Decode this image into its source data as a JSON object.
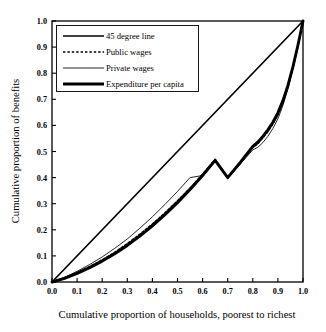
{
  "chart_data": {
    "type": "line",
    "title": "",
    "xlabel": "Cumulative proportion of households, poorest to richest",
    "ylabel": "Cumulative proportion of benefits",
    "xlim": [
      0.0,
      1.0
    ],
    "ylim": [
      0.0,
      1.0
    ],
    "grid": false,
    "legend_position": "top-left inside plot area",
    "xticks": [
      "0.0",
      "0.1",
      "0.2",
      "0.3",
      "0.4",
      "0.5",
      "0.6",
      "0.7",
      "0.8",
      "0.9",
      "1.0"
    ],
    "yticks": [
      "0.0",
      "0.1",
      "0.2",
      "0.3",
      "0.4",
      "0.5",
      "0.6",
      "0.7",
      "0.8",
      "0.9",
      "1.0"
    ],
    "xtick_values": [
      0.0,
      0.1,
      0.2,
      0.3,
      0.4,
      0.5,
      0.6,
      0.7,
      0.8,
      0.9,
      1.0
    ],
    "ytick_values": [
      0.0,
      0.1,
      0.2,
      0.3,
      0.4,
      0.5,
      0.6,
      0.7,
      0.8,
      0.9,
      1.0
    ],
    "series": [
      {
        "name": "45 degree line",
        "style": "solid-medium",
        "x": [
          0.0,
          1.0
        ],
        "values": [
          0.0,
          1.0
        ]
      },
      {
        "name": "Public wages",
        "style": "dotted",
        "x": [
          0.0,
          0.05,
          0.1,
          0.15,
          0.2,
          0.25,
          0.3,
          0.35,
          0.4,
          0.45,
          0.5,
          0.55,
          0.6,
          0.65,
          0.7,
          0.75,
          0.8,
          0.82,
          0.84,
          0.86,
          0.88,
          0.9,
          0.92,
          0.94,
          0.96,
          0.98,
          1.0
        ],
        "values": [
          0.0,
          0.016,
          0.036,
          0.059,
          0.085,
          0.114,
          0.147,
          0.183,
          0.222,
          0.265,
          0.311,
          0.36,
          0.413,
          0.47,
          0.4,
          0.455,
          0.515,
          0.53,
          0.552,
          0.576,
          0.605,
          0.64,
          0.688,
          0.748,
          0.822,
          0.905,
          1.0
        ]
      },
      {
        "name": "Private wages",
        "style": "solid-thin",
        "x": [
          0.0,
          0.05,
          0.1,
          0.15,
          0.2,
          0.25,
          0.3,
          0.35,
          0.4,
          0.45,
          0.5,
          0.55,
          0.6,
          0.65,
          0.7,
          0.75,
          0.8,
          0.82,
          0.84,
          0.86,
          0.88,
          0.9,
          0.92,
          0.94,
          0.96,
          0.98,
          1.0
        ],
        "values": [
          0.0,
          0.018,
          0.041,
          0.067,
          0.096,
          0.129,
          0.165,
          0.206,
          0.25,
          0.297,
          0.347,
          0.4,
          0.408,
          0.464,
          0.4,
          0.452,
          0.506,
          0.516,
          0.534,
          0.558,
          0.588,
          0.625,
          0.676,
          0.74,
          0.818,
          0.903,
          1.0
        ]
      },
      {
        "name": "Expenditure per capita",
        "style": "solid-thick",
        "x": [
          0.0,
          0.05,
          0.1,
          0.15,
          0.2,
          0.25,
          0.3,
          0.35,
          0.4,
          0.45,
          0.5,
          0.55,
          0.6,
          0.65,
          0.7,
          0.75,
          0.8,
          0.82,
          0.84,
          0.86,
          0.88,
          0.9,
          0.92,
          0.94,
          0.96,
          0.98,
          1.0
        ],
        "values": [
          0.0,
          0.014,
          0.033,
          0.055,
          0.08,
          0.108,
          0.14,
          0.176,
          0.215,
          0.258,
          0.304,
          0.354,
          0.408,
          0.466,
          0.4,
          0.458,
          0.52,
          0.536,
          0.558,
          0.583,
          0.612,
          0.648,
          0.695,
          0.753,
          0.825,
          0.908,
          1.0
        ]
      }
    ]
  },
  "legend": {
    "entries": [
      {
        "label": "45 degree line",
        "style": "solid-medium"
      },
      {
        "label": "Public wages",
        "style": "dotted"
      },
      {
        "label": "Private wages",
        "style": "solid-thin"
      },
      {
        "label": "Expenditure per capita",
        "style": "solid-thick"
      }
    ]
  },
  "axes": {
    "x_title": "Cumulative proportion of households, poorest to richest",
    "y_title": "Cumulative proportion of benefits"
  }
}
